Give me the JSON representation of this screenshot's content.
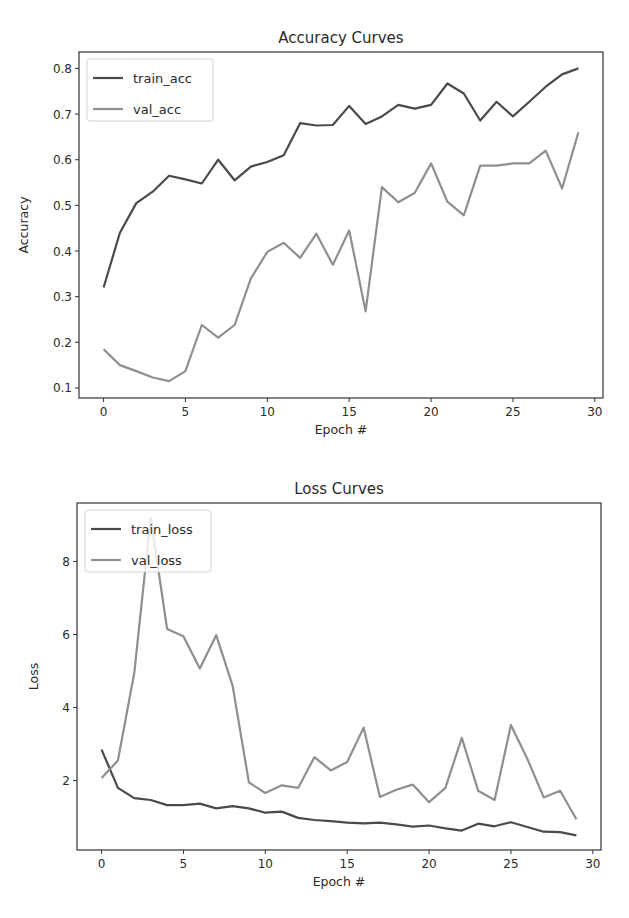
{
  "chart_data": [
    {
      "type": "line",
      "title": "Accuracy Curves",
      "xlabel": "Epoch #",
      "ylabel": "Accuracy",
      "xlim": [
        -1.5,
        30.5
      ],
      "ylim": [
        0.078,
        0.836
      ],
      "xticks": [
        0,
        5,
        10,
        15,
        20,
        25,
        30
      ],
      "yticks": [
        0.1,
        0.2,
        0.3,
        0.4,
        0.5,
        0.6,
        0.7,
        0.8
      ],
      "ytick_labels": [
        "0.1",
        "0.2",
        "0.3",
        "0.4",
        "0.5",
        "0.6",
        "0.7",
        "0.8"
      ],
      "grid": false,
      "legend_position": "upper left",
      "x": [
        0,
        1,
        2,
        3,
        4,
        5,
        6,
        7,
        8,
        9,
        10,
        11,
        12,
        13,
        14,
        15,
        16,
        17,
        18,
        19,
        20,
        21,
        22,
        23,
        24,
        25,
        26,
        27,
        28,
        29
      ],
      "series": [
        {
          "name": "train_acc",
          "color": "#4a4a4a",
          "values": [
            0.32,
            0.44,
            0.505,
            0.53,
            0.565,
            0.557,
            0.548,
            0.6,
            0.555,
            0.585,
            0.595,
            0.61,
            0.68,
            0.675,
            0.676,
            0.718,
            0.678,
            0.695,
            0.72,
            0.712,
            0.72,
            0.767,
            0.745,
            0.686,
            0.727,
            0.695,
            0.727,
            0.76,
            0.787,
            0.8
          ]
        },
        {
          "name": "val_acc",
          "color": "#8f8f8f",
          "values": [
            0.185,
            0.15,
            0.137,
            0.123,
            0.115,
            0.137,
            0.238,
            0.21,
            0.238,
            0.34,
            0.398,
            0.418,
            0.385,
            0.438,
            0.37,
            0.445,
            0.268,
            0.54,
            0.507,
            0.527,
            0.592,
            0.508,
            0.478,
            0.587,
            0.587,
            0.592,
            0.592,
            0.62,
            0.537,
            0.66
          ]
        }
      ]
    },
    {
      "type": "line",
      "title": "Loss Curves",
      "xlabel": "Epoch #",
      "ylabel": "Loss",
      "xlim": [
        -1.5,
        30.5
      ],
      "ylim": [
        0.1,
        9.6
      ],
      "xticks": [
        0,
        5,
        10,
        15,
        20,
        25,
        30
      ],
      "yticks": [
        2,
        4,
        6,
        8
      ],
      "ytick_labels": [
        "2",
        "4",
        "6",
        "8"
      ],
      "grid": false,
      "legend_position": "upper left",
      "x": [
        0,
        1,
        2,
        3,
        4,
        5,
        6,
        7,
        8,
        9,
        10,
        11,
        12,
        13,
        14,
        15,
        16,
        17,
        18,
        19,
        20,
        21,
        22,
        23,
        24,
        25,
        26,
        27,
        28,
        29
      ],
      "series": [
        {
          "name": "train_loss",
          "color": "#4a4a4a",
          "values": [
            2.85,
            1.8,
            1.52,
            1.47,
            1.33,
            1.33,
            1.37,
            1.24,
            1.3,
            1.24,
            1.12,
            1.15,
            0.98,
            0.92,
            0.89,
            0.85,
            0.83,
            0.85,
            0.8,
            0.74,
            0.77,
            0.69,
            0.63,
            0.82,
            0.75,
            0.86,
            0.73,
            0.6,
            0.59,
            0.5
          ]
        },
        {
          "name": "val_loss",
          "color": "#8f8f8f",
          "values": [
            2.07,
            2.55,
            4.95,
            9.2,
            6.15,
            5.95,
            5.07,
            5.98,
            4.6,
            1.95,
            1.66,
            1.87,
            1.8,
            2.64,
            2.28,
            2.51,
            3.45,
            1.55,
            1.75,
            1.89,
            1.41,
            1.8,
            3.17,
            1.72,
            1.47,
            3.52,
            2.6,
            1.54,
            1.72,
            0.94
          ]
        }
      ]
    }
  ]
}
